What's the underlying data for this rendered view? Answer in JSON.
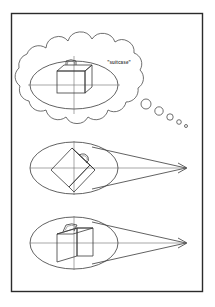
{
  "figure": {
    "background_color": "#ffffff",
    "frame_color": "#2b2b2b",
    "line_color": "#3a3a3a",
    "frame": {
      "x": 11,
      "y": 13,
      "width": 192,
      "height": 279
    }
  },
  "panels": [
    {
      "id": "thought-panel",
      "kind": "thought-bubble",
      "label": "\"suitcase\"",
      "label_x": 119,
      "label_y": 64,
      "bubble": {
        "cx": 78,
        "cy": 80,
        "rx": 64,
        "ry": 48
      },
      "ellipse": {
        "cx": 74,
        "cy": 85,
        "rx": 44,
        "ry": 24
      },
      "object": {
        "type": "suitcase",
        "orientation": "upright-front",
        "cx": 72,
        "cy": 83
      },
      "tail_bubbles": [
        {
          "cx": 146,
          "cy": 104,
          "r": 5.0
        },
        {
          "cx": 159,
          "cy": 111,
          "r": 4.2
        },
        {
          "cx": 170,
          "cy": 117,
          "r": 3.2
        },
        {
          "cx": 179,
          "cy": 122,
          "r": 2.3
        },
        {
          "cx": 186,
          "cy": 126,
          "r": 1.5
        }
      ]
    },
    {
      "id": "view-cone-panel-rotated",
      "kind": "view-cone",
      "ellipse": {
        "cx": 74,
        "cy": 168,
        "rx": 44,
        "ry": 26
      },
      "apex": {
        "x": 186,
        "y": 168
      },
      "object": {
        "type": "suitcase",
        "orientation": "rotated-45",
        "cx": 70,
        "cy": 168
      },
      "arrow": {
        "x": 186,
        "y": 168,
        "direction": "right"
      }
    },
    {
      "id": "view-cone-panel-upright",
      "kind": "view-cone",
      "ellipse": {
        "cx": 74,
        "cy": 243,
        "rx": 44,
        "ry": 26
      },
      "apex": {
        "x": 186,
        "y": 243
      },
      "object": {
        "type": "suitcase",
        "orientation": "upright-3d",
        "cx": 70,
        "cy": 243
      },
      "arrow": {
        "x": 186,
        "y": 243,
        "direction": "right"
      }
    }
  ]
}
